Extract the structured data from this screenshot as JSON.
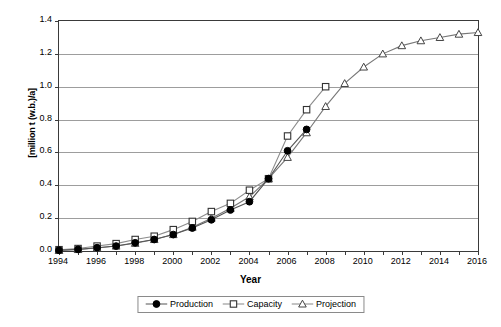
{
  "chart_data": {
    "type": "line",
    "title": "",
    "xlabel": "Year",
    "ylabel": "[million t (w.b.)/a]",
    "xlim": [
      1994,
      2016
    ],
    "ylim": [
      0.0,
      1.4
    ],
    "grid": true,
    "legend_position": "bottom",
    "x_tick_labels": [
      "1994",
      "1996",
      "1998",
      "2000",
      "2002",
      "2004",
      "2006",
      "2008",
      "2010",
      "2012",
      "2014",
      "2016"
    ],
    "y_tick_labels": [
      "0.0",
      "0.2",
      "0.4",
      "0.6",
      "0.8",
      "1.0",
      "1.2",
      "1.4"
    ],
    "x_tick_values": [
      1994,
      1996,
      1998,
      2000,
      2002,
      2004,
      2006,
      2008,
      2010,
      2012,
      2014,
      2016
    ],
    "y_tick_values": [
      0.0,
      0.2,
      0.4,
      0.6,
      0.8,
      1.0,
      1.2,
      1.4
    ],
    "series": [
      {
        "name": "Production",
        "marker": "filled-circle",
        "x": [
          1994,
          1995,
          1996,
          1997,
          1998,
          1999,
          2000,
          2001,
          2002,
          2003,
          2004,
          2005,
          2006,
          2007
        ],
        "values": [
          0.005,
          0.01,
          0.02,
          0.03,
          0.05,
          0.07,
          0.1,
          0.14,
          0.19,
          0.25,
          0.3,
          0.44,
          0.61,
          0.74
        ]
      },
      {
        "name": "Capacity",
        "marker": "open-square",
        "x": [
          1994,
          1995,
          1996,
          1997,
          1998,
          1999,
          2000,
          2001,
          2002,
          2003,
          2004,
          2005,
          2006,
          2007,
          2008
        ],
        "values": [
          0.008,
          0.015,
          0.03,
          0.045,
          0.07,
          0.09,
          0.13,
          0.18,
          0.24,
          0.29,
          0.37,
          0.44,
          0.7,
          0.86,
          1.0
        ]
      },
      {
        "name": "Projection",
        "marker": "open-triangle",
        "x": [
          1994,
          1995,
          1996,
          1997,
          1998,
          1999,
          2000,
          2001,
          2002,
          2003,
          2004,
          2005,
          2006,
          2007,
          2008,
          2009,
          2010,
          2011,
          2012,
          2013,
          2014,
          2015,
          2016
        ],
        "values": [
          0.004,
          0.009,
          0.018,
          0.03,
          0.047,
          0.07,
          0.1,
          0.145,
          0.2,
          0.26,
          0.33,
          0.44,
          0.57,
          0.72,
          0.88,
          1.02,
          1.12,
          1.2,
          1.25,
          1.28,
          1.3,
          1.32,
          1.33
        ]
      }
    ]
  },
  "legend": {
    "items": [
      {
        "label": "Production",
        "marker": "filled-circle"
      },
      {
        "label": "Capacity",
        "marker": "open-square"
      },
      {
        "label": "Projection",
        "marker": "open-triangle"
      }
    ]
  }
}
